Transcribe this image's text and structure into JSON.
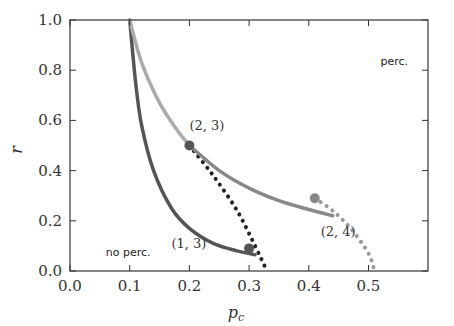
{
  "chart_data": {
    "type": "line",
    "title": "",
    "xlabel": "p_c",
    "ylabel": "r",
    "xlim": [
      0.0,
      0.6
    ],
    "ylim": [
      0.0,
      1.0
    ],
    "x_ticks": [
      "0.0",
      "0.1",
      "0.2",
      "0.3",
      "0.4",
      "0.5"
    ],
    "y_ticks": [
      "0.0",
      "0.2",
      "0.4",
      "0.6",
      "0.8",
      "1.0"
    ],
    "grid": false,
    "legend": null,
    "annotations": [
      {
        "text": "(2, 3)",
        "x": 0.2,
        "y": 0.56
      },
      {
        "text": "(1, 3)",
        "x": 0.17,
        "y": 0.09
      },
      {
        "text": "(2, 4)",
        "x": 0.42,
        "y": 0.14
      },
      {
        "text": "no perc.",
        "x": 0.06,
        "y": 0.06
      },
      {
        "text": "perc.",
        "x": 0.52,
        "y": 0.82
      }
    ],
    "series": [
      {
        "name": "(1,3) solid",
        "style": "solid",
        "color": "#555555",
        "x": [
          0.1,
          0.11,
          0.12,
          0.14,
          0.17,
          0.2,
          0.24,
          0.28,
          0.31
        ],
        "y": [
          1.0,
          0.75,
          0.58,
          0.4,
          0.25,
          0.17,
          0.11,
          0.08,
          0.065
        ]
      },
      {
        "name": "(1,3) dotted",
        "style": "dotted",
        "color": "#222222",
        "x": [
          0.2,
          0.24,
          0.28,
          0.31,
          0.33
        ],
        "y": [
          0.5,
          0.38,
          0.24,
          0.1,
          0.0
        ]
      },
      {
        "name": "(2,3) solid",
        "style": "solid",
        "color": "#aaaaaa",
        "x": [
          0.1,
          0.12,
          0.15,
          0.18,
          0.2
        ],
        "y": [
          1.0,
          0.83,
          0.67,
          0.56,
          0.5
        ]
      },
      {
        "name": "(2,4) solid",
        "style": "solid",
        "color": "#888888",
        "x": [
          0.2,
          0.25,
          0.3,
          0.35,
          0.4,
          0.44
        ],
        "y": [
          0.5,
          0.4,
          0.33,
          0.28,
          0.245,
          0.22
        ]
      },
      {
        "name": "(2,4) dotted",
        "style": "dotted",
        "color": "#999999",
        "x": [
          0.41,
          0.44,
          0.47,
          0.5,
          0.51
        ],
        "y": [
          0.29,
          0.24,
          0.17,
          0.07,
          0.0
        ]
      }
    ],
    "markers": [
      {
        "x": 0.2,
        "y": 0.5,
        "color": "#555555"
      },
      {
        "x": 0.3,
        "y": 0.09,
        "color": "#555555"
      },
      {
        "x": 0.41,
        "y": 0.29,
        "color": "#888888"
      }
    ]
  }
}
